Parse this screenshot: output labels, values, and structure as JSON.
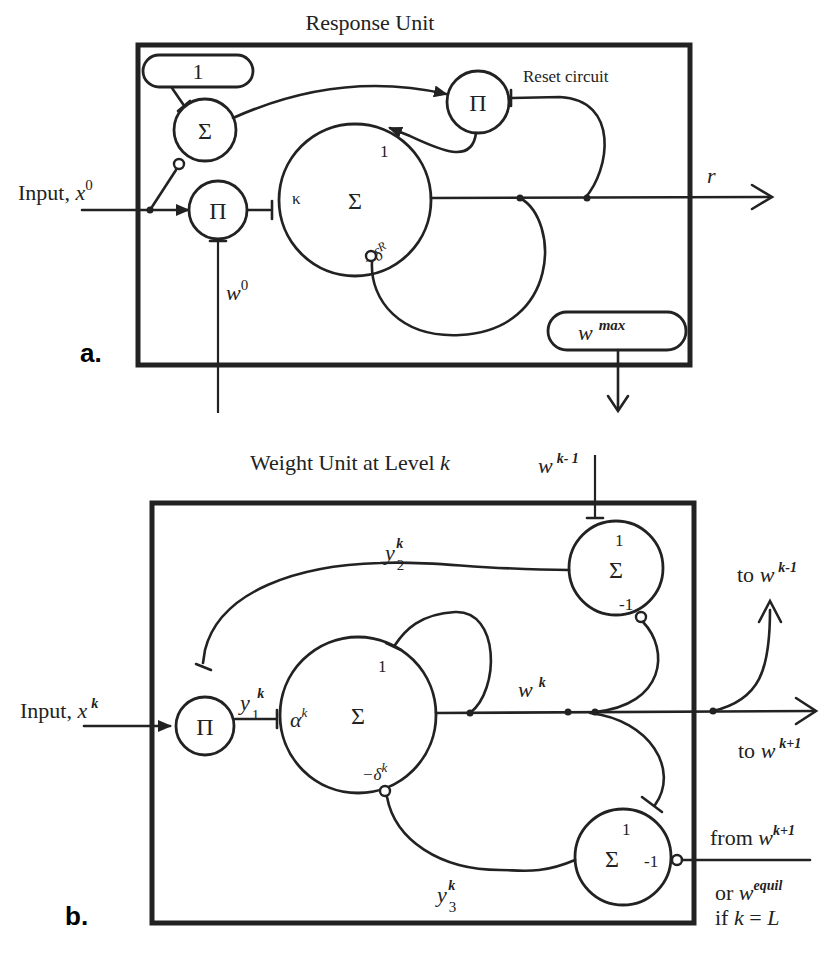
{
  "panel_a": {
    "title": "Response Unit",
    "panel_label": "a.",
    "bias_box_value": "1",
    "input_label": "Input, ",
    "input_var": "x",
    "input_sup": "0",
    "reset_label": "Reset circuit",
    "sum_symbol": "Σ",
    "prod_symbol": "Π",
    "kappa": "κ",
    "main_gain": "1",
    "decay": "−δ",
    "decay_sup": "R",
    "weight_var": "w",
    "weight_sup": "0",
    "output_var": "r",
    "wmax_var": "w",
    "wmax_sup": "max"
  },
  "panel_b": {
    "title": "Weight Unit at Level ",
    "title_var": "k",
    "panel_label": "b.",
    "input_label": "Input, ",
    "input_var": "x",
    "input_sup": "k",
    "top_input_var": "w",
    "top_input_sup": "k- 1",
    "sum_symbol": "Σ",
    "prod_symbol": "Π",
    "alpha": "α",
    "alpha_sup": "k",
    "main_gain": "1",
    "decay": "−δ",
    "decay_sup": "k",
    "y1_var": "y",
    "y1_sub": "1",
    "y1_sup": "k",
    "y2_var": "y",
    "y2_sub": "2",
    "y2_sup": "k",
    "y3_var": "y",
    "y3_sub": "3",
    "y3_sup": "k",
    "wk_var": "w",
    "wk_sup": "k",
    "upper_sum_plus": "1",
    "upper_sum_minus": "-1",
    "lower_sum_plus": "1",
    "lower_sum_minus": "-1",
    "to_prev_label": "to ",
    "to_prev_var": "w",
    "to_prev_sup": "k-1",
    "to_next_label": "to ",
    "to_next_var": "w",
    "to_next_sup": "k+1",
    "from_next_label": "from ",
    "from_next_var": "w",
    "from_next_sup": "k+1",
    "or_label": "or ",
    "or_var": "w",
    "or_sup": "equil",
    "if_label": "if ",
    "if_cond_k": "k",
    "if_cond_eq": " = ",
    "if_cond_L": "L"
  }
}
